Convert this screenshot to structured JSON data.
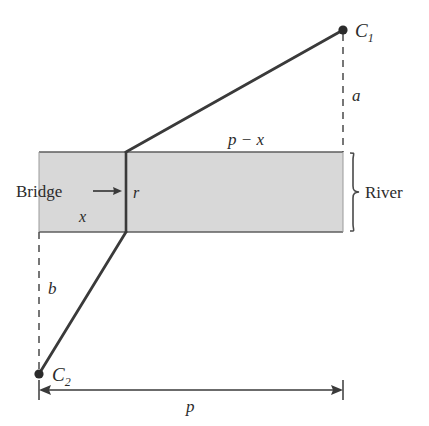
{
  "figure": {
    "type": "geometry-diagram",
    "colors": {
      "river_fill": "#d8d8d8",
      "river_border": "#6a6a6a",
      "line": "#3a3a3a",
      "text": "#2b2b2b",
      "dashed": "#4a4a4a"
    }
  },
  "labels": {
    "city_one": "C",
    "city_one_sub": "1",
    "city_two": "C",
    "city_two_sub": "2",
    "bridge": "Bridge",
    "river": "River",
    "bridge_segment": "r",
    "left_horizontal": "x",
    "right_horizontal": "p − x",
    "vertical_upper": "a",
    "vertical_lower": "b",
    "total_width": "p"
  },
  "geometry": {
    "river": {
      "x": 39,
      "y": 152,
      "width": 304,
      "height": 80
    },
    "bridge_line": {
      "x": 126,
      "y_top": 152,
      "y_bottom": 232
    },
    "city_one_point": {
      "x": 343,
      "y": 30
    },
    "city_two_point": {
      "x": 39,
      "y": 374
    },
    "path_upper": {
      "x1": 126,
      "y1": 152,
      "x2": 343,
      "y2": 30
    },
    "path_lower": {
      "x1": 126,
      "y1": 232,
      "x2": 39,
      "y2": 374
    },
    "dashed_a": {
      "x": 343,
      "y_top": 32,
      "y_bottom": 152
    },
    "dashed_b": {
      "x": 39,
      "y_top": 232,
      "y_bottom": 372
    },
    "dimension_p": {
      "y": 390,
      "x_left": 39,
      "x_right": 343
    }
  },
  "label_positions": {
    "city_one": {
      "x": 355,
      "y": 36
    },
    "city_two": {
      "x": 52,
      "y": 381
    },
    "bridge": {
      "x": 46,
      "y": 196
    },
    "river": {
      "x": 372,
      "y": 198
    },
    "bridge_segment": {
      "x": 133,
      "y": 197
    },
    "left_horizontal": {
      "x": 82,
      "y": 221
    },
    "right_horizontal": {
      "x": 232,
      "y": 144
    },
    "vertical_upper": {
      "x": 354,
      "y": 100
    },
    "vertical_lower": {
      "x": 51,
      "y": 293
    },
    "total_width": {
      "x": 191,
      "y": 411
    }
  }
}
